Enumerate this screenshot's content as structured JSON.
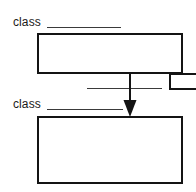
{
  "diagram": {
    "background_color": "#ffffff",
    "line_color": "#141414",
    "rule_color": "#3a3a3a",
    "classes": [
      {
        "id": "superclass",
        "label": "class",
        "name_blank": "",
        "members": [
          {
            "field_blank": "",
            "value_box": ""
          }
        ]
      },
      {
        "id": "subclass",
        "label": "class",
        "name_blank": "",
        "members": [
          {
            "field_blank": "",
            "value_box": ""
          },
          {
            "field_blank": "",
            "value_box": ""
          }
        ]
      }
    ],
    "connector": {
      "type": "arrow",
      "direction": "down",
      "from": "superclass",
      "to": "subclass"
    }
  }
}
